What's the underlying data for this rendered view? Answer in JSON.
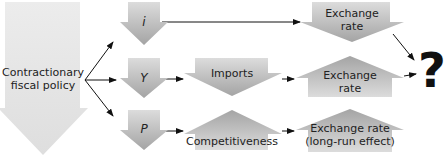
{
  "diagram": {
    "source": {
      "label_line1": "Contractionary",
      "label_line2": "fiscal policy",
      "direction": "down"
    },
    "branches": [
      {
        "variable": "i",
        "variable_direction": "down",
        "steps": [
          {
            "label_line1": "Exchange",
            "label_line2": "rate",
            "direction": "down"
          }
        ]
      },
      {
        "variable": "Y",
        "variable_direction": "down",
        "steps": [
          {
            "label_line1": "Imports",
            "label_line2": "",
            "direction": "down"
          },
          {
            "label_line1": "Exchange",
            "label_line2": "rate",
            "direction": "up"
          }
        ]
      },
      {
        "variable": "P",
        "variable_direction": "down",
        "steps": [
          {
            "label_line1": "Competitiveness",
            "label_line2": "",
            "direction": "up"
          },
          {
            "label_line1": "Exchange rate",
            "label_line2": "(long-run effect)",
            "direction": "up"
          }
        ]
      }
    ],
    "result": "?",
    "colors": {
      "big_arrow": "#e6e6e6",
      "arrow_light": "#dadada",
      "arrow_dark": "#a6a6a6",
      "text": "#222222"
    }
  }
}
